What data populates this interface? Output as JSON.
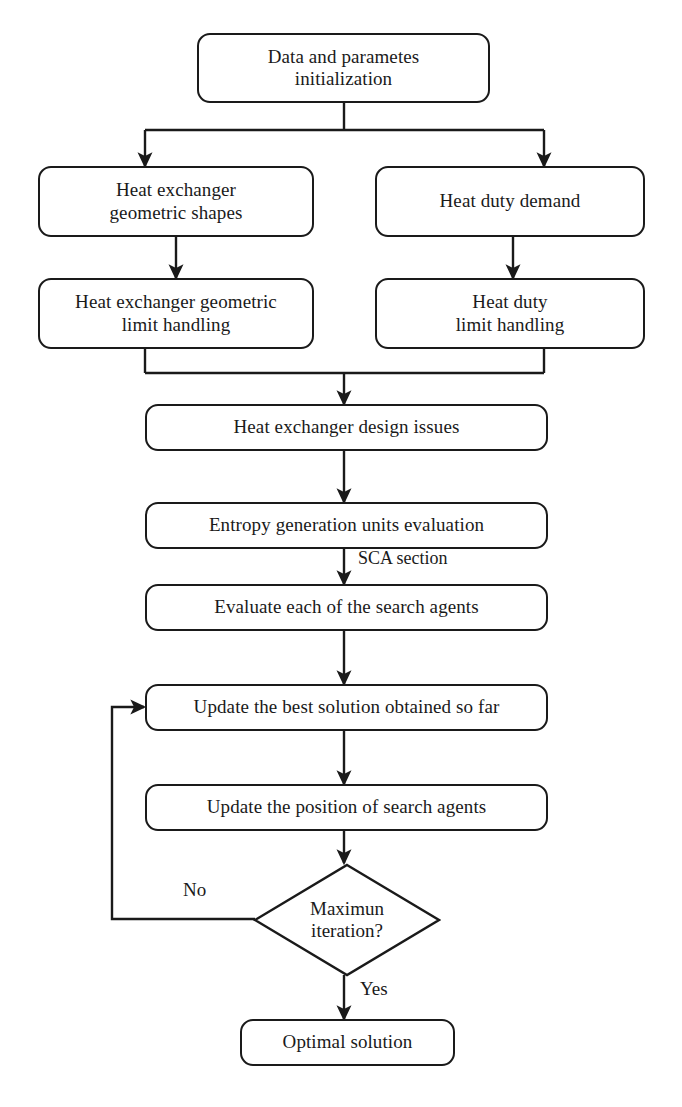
{
  "diagram": {
    "stroke_color": "#1a1a1a",
    "fill_color": "#ffffff"
  },
  "nodes": {
    "init": "Data and parametes\ninitialization",
    "geometric_shapes": "Heat exchanger\ngeometric shapes",
    "heat_duty_demand": "Heat duty demand",
    "geometric_limit": "Heat exchanger geometric\nlimit handling",
    "heat_duty_limit": "Heat duty\nlimit handling",
    "design_issues": "Heat exchanger design issues",
    "entropy_eval": "Entropy generation units evaluation",
    "evaluate_agents": "Evaluate each of the search agents",
    "update_best": "Update the best solution obtained so far",
    "update_position": "Update the position of search agents",
    "max_iteration": "Maximun\niteration?",
    "optimal_solution": "Optimal solution"
  },
  "edge_labels": {
    "sca_section": "SCA section",
    "no": "No",
    "yes": "Yes"
  }
}
